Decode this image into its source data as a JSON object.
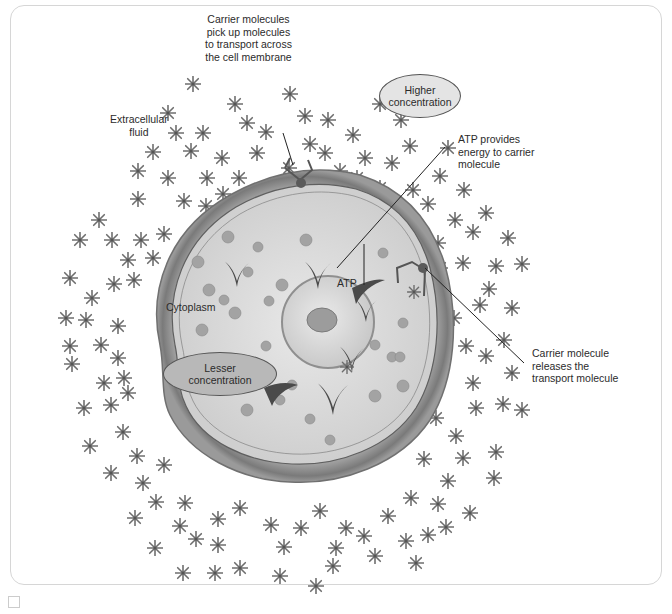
{
  "figure": {
    "labels": {
      "carrier_pickup": [
        "Carrier molecules",
        "pick up molecules",
        "to transport across",
        "the cell membrane"
      ],
      "higher_concentration": [
        "Higher",
        "concentration"
      ],
      "extracellular_fluid": [
        "Extracellular",
        "fluid"
      ],
      "atp_provides": [
        "ATP provides",
        "energy to carrier",
        "molecule"
      ],
      "atp": "ATP",
      "cytoplasm": "Cytoplasm",
      "lesser_concentration": [
        "Lesser",
        "concentration"
      ],
      "carrier_release": [
        "Carrier molecule",
        "releases the",
        "transport molecule"
      ]
    },
    "colors": {
      "molecule_star": "#6e6e6e",
      "cell_membrane": "#8a8a8a",
      "cytoplasm": "#d9d9d9",
      "organelle_dot": "#a3a3a3",
      "carrier": "#555555",
      "oval_fill_outside": "#e4e4e4",
      "oval_fill_inside": "#b8b8b8",
      "frame_border": "#d6d6d6"
    },
    "icons": [
      "molecule-star-icon",
      "carrier-molecule-icon",
      "atp-chevron-icon",
      "nucleus-icon"
    ]
  }
}
